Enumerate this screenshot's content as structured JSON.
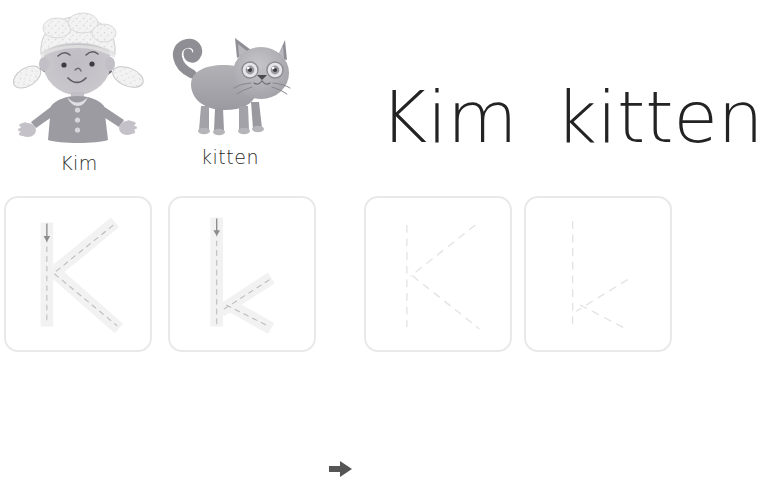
{
  "worksheet": {
    "letter_upper": "K",
    "letter_lower": "k",
    "background_color": "#ffffff"
  },
  "illustrations": [
    {
      "name": "girl",
      "caption": "Kim",
      "alt": "illustration of a girl named Kim wearing a bonnet with pigtails"
    },
    {
      "name": "kitten",
      "caption": "kitten",
      "alt": "illustration of a grey kitten standing with tail raised"
    }
  ],
  "headline": {
    "word_one": "Kim",
    "word_two": "kitten",
    "color": "#232323"
  },
  "tracing": {
    "arrow_icon": "arrow-right-icon",
    "arrow_color": "#555555",
    "box_border_color": "#e9e9e9",
    "guide_fill_color": "#f2f2f2",
    "guide_dash_color": "#b9b9b9",
    "faint_dash_color": "#e6e6e6",
    "stroke_arrow_color": "#8c8c8c",
    "boxes": [
      {
        "name": "trace-box-uppercase-k",
        "letter": "K",
        "case": "uppercase",
        "mode": "guided",
        "has_start_arrow": true,
        "has_dashed_guides": true
      },
      {
        "name": "trace-box-lowercase-k",
        "letter": "k",
        "case": "lowercase",
        "mode": "guided",
        "has_start_arrow": true,
        "has_dashed_guides": true
      },
      {
        "name": "practice-box-uppercase-k",
        "letter": "K",
        "case": "uppercase",
        "mode": "practice",
        "has_start_arrow": false,
        "has_dashed_guides": true
      },
      {
        "name": "practice-box-lowercase-k",
        "letter": "k",
        "case": "lowercase",
        "mode": "practice",
        "has_start_arrow": false,
        "has_dashed_guides": true
      }
    ]
  },
  "palette": {
    "skin": "#c9c6cc",
    "skin_shade": "#b4b1b8",
    "hat": "#efefef",
    "dress": "#9c9ba2",
    "dress_dark": "#8b8a92",
    "cat_body": "#aaa9ae",
    "cat_dark": "#8f8e95",
    "cat_face": "#bcbbc0",
    "outline": "#6f6e74"
  }
}
